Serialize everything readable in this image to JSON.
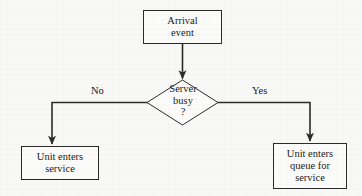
{
  "diagram": {
    "type": "flowchart",
    "background_color": "#f8f8f7",
    "line_color": "#2b2b2b",
    "text_color": "#1c1c1c",
    "nodes": {
      "arrival": {
        "label": "Arrival\nevent",
        "shape": "rectangle"
      },
      "decision": {
        "label": "Server\nbusy\n?",
        "shape": "diamond"
      },
      "enters_service": {
        "label": "Unit enters\nservice",
        "shape": "rectangle"
      },
      "enters_queue": {
        "label": "Unit enters\nqueue for\nservice",
        "shape": "rectangle"
      }
    },
    "edges": {
      "no_label": "No",
      "yes_label": "Yes"
    }
  }
}
